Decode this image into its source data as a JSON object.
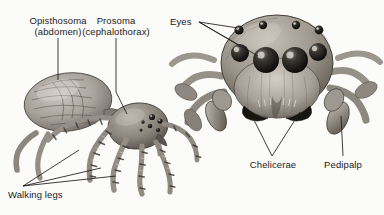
{
  "figure": {
    "background_color": "#fbfbf9",
    "ink_color": "#1b1b1b",
    "subjects": [
      {
        "name": "spider-lateral-view",
        "description": "Pencil drawing of a jumping spider in side/oblique view, abdomen at left, cephalothorax and banded walking legs at right"
      },
      {
        "name": "spider-frontal-view",
        "description": "Pencil drawing of a jumping spider face-on, showing eight eyes, chelicerae and pedipalps"
      }
    ]
  },
  "labels": {
    "opisthosoma": {
      "line1": "Opisthosoma",
      "line2": "(abdomen)"
    },
    "prosoma": {
      "line1": "Prosoma",
      "line2": "(cephalothorax)"
    },
    "eyes": {
      "line1": "Eyes",
      "line2": ""
    },
    "walking_legs": {
      "line1": "Walking legs",
      "line2": ""
    },
    "chelicerae": {
      "line1": "Chelicerae",
      "line2": ""
    },
    "pedipalp": {
      "line1": "Pedipalp",
      "line2": ""
    }
  }
}
